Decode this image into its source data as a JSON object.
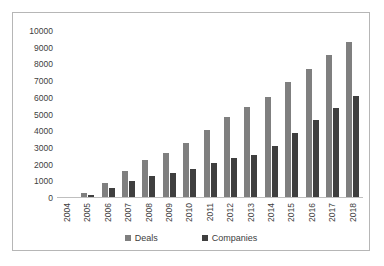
{
  "chart_data": {
    "type": "bar",
    "title": "",
    "subtitle": "",
    "xlabel": "",
    "ylabel": "",
    "ylim": [
      0,
      10000
    ],
    "yticks": [
      0,
      1000,
      2000,
      3000,
      4000,
      5000,
      6000,
      7000,
      8000,
      9000,
      10000
    ],
    "ytick_labels": [
      "0",
      "1000",
      "2000",
      "3000",
      "4000",
      "5000",
      "6000",
      "7000",
      "8000",
      "9000",
      "10000"
    ],
    "grid": false,
    "legend_position": "bottom",
    "categories": [
      "2004",
      "2005",
      "2006",
      "2007",
      "2008",
      "2009",
      "2010",
      "2011",
      "2012",
      "2013",
      "2014",
      "2015",
      "2016",
      "2017",
      "2018"
    ],
    "series": [
      {
        "name": "Deals",
        "color": "#7f7f7f",
        "values": [
          50,
          330,
          900,
          1600,
          2300,
          2720,
          3280,
          4080,
          4850,
          5470,
          6060,
          6950,
          7740,
          8550,
          9370
        ]
      },
      {
        "name": "Companies",
        "color": "#3f3f3f",
        "values": [
          30,
          200,
          570,
          990,
          1330,
          1510,
          1760,
          2070,
          2370,
          2580,
          3120,
          3910,
          4650,
          5370,
          6120
        ]
      }
    ]
  },
  "colors": {
    "deals": "#7f7f7f",
    "companies": "#3f3f3f",
    "axis": "#bfbfbf",
    "border": "#b6b6b6",
    "text": "#404040",
    "background": "#ffffff"
  }
}
